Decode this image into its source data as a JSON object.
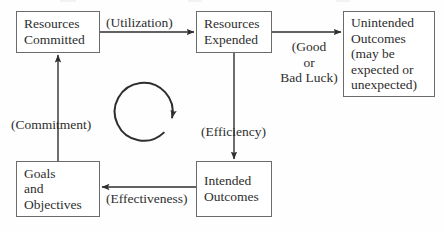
{
  "diagram": {
    "type": "flowchart-feedback-loop",
    "background_color": "#fefefe",
    "stroke_color": "#2e2e2e",
    "box_border_color": "#6b6b6b",
    "text_color": "#2e2e2e",
    "nodes": [
      {
        "id": "resources-committed",
        "label": "Resources\nCommitted",
        "x": 16,
        "y": 11,
        "w": 84,
        "h": 42,
        "align": "left"
      },
      {
        "id": "resources-expended",
        "label": "Resources\nExpended",
        "x": 196,
        "y": 11,
        "w": 76,
        "h": 42,
        "align": "left"
      },
      {
        "id": "unintended-outcomes",
        "label": "Unintended\nOutcomes\n(may be\nexpected or\nunexpected)",
        "x": 343,
        "y": 11,
        "w": 92,
        "h": 86,
        "align": "left"
      },
      {
        "id": "goals-and-objectives",
        "label": "Goals\nand\nObjectives",
        "x": 16,
        "y": 161,
        "w": 84,
        "h": 56,
        "align": "left"
      },
      {
        "id": "intended-outcomes",
        "label": "Intended\nOutcomes",
        "x": 196,
        "y": 161,
        "w": 76,
        "h": 56,
        "align": "left"
      }
    ],
    "edge_labels": [
      {
        "id": "utilization",
        "text": "(Utilization)",
        "x": 106,
        "y": 15,
        "align": "left"
      },
      {
        "id": "good-or-bad-luck",
        "text": "(Good\nor\nBad Luck)",
        "x": 280,
        "y": 40,
        "align": "center"
      },
      {
        "id": "efficiency",
        "text": "(Efficiency)",
        "x": 201,
        "y": 124,
        "align": "left"
      },
      {
        "id": "commitment",
        "text": "(Commitment)",
        "x": 11,
        "y": 117,
        "align": "left"
      },
      {
        "id": "effectiveness",
        "text": "(Effectiveness)",
        "x": 106,
        "y": 191,
        "align": "left"
      }
    ],
    "edges": [
      {
        "id": "committed-to-expended",
        "from": "resources-committed",
        "to": "resources-expended",
        "label": "(Utilization)",
        "direction": "right"
      },
      {
        "id": "expended-to-unintended",
        "from": "resources-expended",
        "to": "unintended-outcomes",
        "label": "(Good or Bad Luck)",
        "direction": "right"
      },
      {
        "id": "expended-to-intended",
        "from": "resources-expended",
        "to": "intended-outcomes",
        "label": "(Efficiency)",
        "direction": "down"
      },
      {
        "id": "intended-to-goals",
        "from": "intended-outcomes",
        "to": "goals-and-objectives",
        "label": "(Effectiveness)",
        "direction": "left"
      },
      {
        "id": "goals-to-committed",
        "from": "goals-and-objectives",
        "to": "resources-committed",
        "label": "(Commitment)",
        "direction": "up"
      }
    ],
    "cycle_arrow": {
      "id": "clockwise-cycle-arrow",
      "center_x": 148,
      "center_y": 110,
      "radius": 29,
      "rotation": "clockwise"
    }
  }
}
